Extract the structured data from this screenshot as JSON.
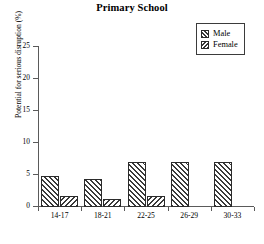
{
  "chart_data": {
    "type": "bar",
    "title": "Primary School",
    "xlabel": "",
    "ylabel": "Potential for serious disruption (%)",
    "categories": [
      "14-17",
      "18-21",
      "22-25",
      "26-29",
      "30-33"
    ],
    "series": [
      {
        "name": "Male",
        "values": [
          4.9,
          4.4,
          7.0,
          7.0,
          7.0
        ]
      },
      {
        "name": "Female",
        "values": [
          1.7,
          1.2,
          1.7,
          0,
          0
        ]
      }
    ],
    "ylim": [
      0,
      25
    ],
    "yticks": [
      0,
      5,
      10,
      15,
      20,
      25
    ],
    "ytick_labels": [
      "0",
      "5",
      "10",
      "15",
      "20",
      "25"
    ],
    "grid": false,
    "legend_position": "top-right",
    "legend_entries": [
      "Male",
      "Female"
    ]
  },
  "colors": {
    "axis": "#5a5a5a",
    "bar_outline": "#2b2b2b",
    "hatch": "#3a3a3a",
    "background": "#ffffff"
  }
}
